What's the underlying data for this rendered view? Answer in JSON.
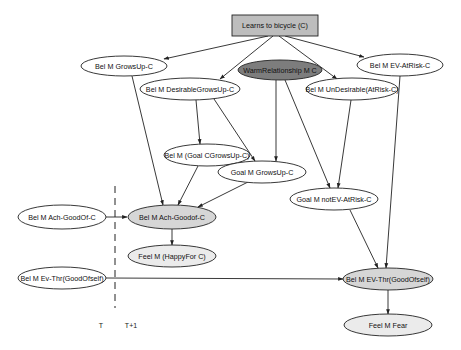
{
  "diagram": {
    "title": "Learns to bicycle (C)",
    "colors": {
      "box_fill": "#bdbdbd",
      "dark_fill": "#7d7d7d",
      "grey_fill": "#d6d6d6",
      "light_fill": "#ebebeb",
      "white_fill": "#ffffff",
      "stroke": "#222222"
    },
    "nodes": [
      {
        "id": "learns",
        "label": "Learns to bicycle (C)",
        "shape": "box",
        "fill": "box"
      },
      {
        "id": "bel_growsup",
        "label": "Bel M GrowsUp-C",
        "shape": "ellipse",
        "fill": "white"
      },
      {
        "id": "warm",
        "label": "WarmRelationship M C",
        "shape": "ellipse",
        "fill": "dark"
      },
      {
        "id": "bel_desirable",
        "label": "Bel M DesirableGrowsUp-C",
        "shape": "ellipse",
        "fill": "white"
      },
      {
        "id": "bel_undesirable",
        "label": "Bel M UnDesirable(AtRisk-C)",
        "shape": "ellipse",
        "fill": "white"
      },
      {
        "id": "bel_ev_atrisk",
        "label": "Bel M EV-AtRisk-C",
        "shape": "ellipse",
        "fill": "white"
      },
      {
        "id": "bel_goal_c",
        "label": "Bel M (Goal CGrowsUp-C)",
        "shape": "ellipse",
        "fill": "white"
      },
      {
        "id": "goal_growsup",
        "label": "Goal M GrowsUp-C",
        "shape": "ellipse",
        "fill": "white"
      },
      {
        "id": "goal_notev",
        "label": "Goal M notEV-AtRisk-C",
        "shape": "ellipse",
        "fill": "white"
      },
      {
        "id": "bel_ach_prev",
        "label": "Bel M Ach-GoodOf-C",
        "shape": "ellipse",
        "fill": "white"
      },
      {
        "id": "bel_ach",
        "label": "Bel M Ach-Goodof-C",
        "shape": "ellipse",
        "fill": "grey"
      },
      {
        "id": "feel_happy",
        "label": "Feel M (HappyFor C)",
        "shape": "ellipse",
        "fill": "light"
      },
      {
        "id": "bel_evthr_prev",
        "label": "Bel M Ev-Thr(GoodOfself)",
        "shape": "ellipse",
        "fill": "white"
      },
      {
        "id": "bel_evthr",
        "label": "Bel M EV-Thr(GoodOfself)",
        "shape": "ellipse",
        "fill": "grey"
      },
      {
        "id": "feel_fear",
        "label": "Feel M Fear",
        "shape": "ellipse",
        "fill": "light"
      }
    ],
    "edges": [
      {
        "from": "learns",
        "to": "bel_growsup"
      },
      {
        "from": "learns",
        "to": "bel_desirable"
      },
      {
        "from": "learns",
        "to": "bel_undesirable"
      },
      {
        "from": "learns",
        "to": "bel_ev_atrisk"
      },
      {
        "from": "bel_growsup",
        "to": "bel_ach"
      },
      {
        "from": "bel_desirable",
        "to": "bel_goal_c"
      },
      {
        "from": "bel_desirable",
        "to": "goal_growsup"
      },
      {
        "from": "warm",
        "to": "goal_growsup"
      },
      {
        "from": "warm",
        "to": "goal_notev"
      },
      {
        "from": "bel_undesirable",
        "to": "goal_notev"
      },
      {
        "from": "bel_ev_atrisk",
        "to": "bel_evthr"
      },
      {
        "from": "bel_goal_c",
        "to": "bel_ach"
      },
      {
        "from": "goal_growsup",
        "to": "bel_ach"
      },
      {
        "from": "goal_notev",
        "to": "bel_evthr"
      },
      {
        "from": "bel_ach_prev",
        "to": "bel_ach"
      },
      {
        "from": "bel_ach",
        "to": "feel_happy"
      },
      {
        "from": "bel_evthr_prev",
        "to": "bel_evthr"
      },
      {
        "from": "bel_evthr",
        "to": "feel_fear"
      }
    ],
    "time_labels": {
      "left": "T",
      "right": "T+1"
    }
  }
}
